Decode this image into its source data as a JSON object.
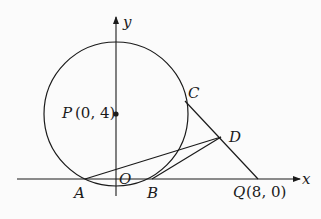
{
  "diagram": {
    "type": "geometry-coordinate-plane",
    "axes": {
      "x_label": "x",
      "y_label": "y",
      "origin_label": "O"
    },
    "circle": {
      "center_label": "P",
      "center_coords": "(0, 4)"
    },
    "points": [
      {
        "label": "P",
        "coords": "(0, 4)"
      },
      {
        "label": "Q",
        "coords": "(8, 0)"
      },
      {
        "label": "A",
        "coords": ""
      },
      {
        "label": "B",
        "coords": ""
      },
      {
        "label": "C",
        "coords": ""
      },
      {
        "label": "D",
        "coords": ""
      },
      {
        "label": "O",
        "coords": ""
      }
    ],
    "segments": [
      "CQ",
      "AD",
      "BD"
    ],
    "colors": {
      "stroke": "#1a1a1a",
      "background": "#fbfbfb"
    }
  },
  "labels": {
    "x": "x",
    "y": "y",
    "O": "O",
    "P": "P",
    "P_coords": "(0, 4)",
    "Q": "Q",
    "Q_coords": "(8, 0)",
    "A": "A",
    "B": "B",
    "C": "C",
    "D": "D"
  }
}
